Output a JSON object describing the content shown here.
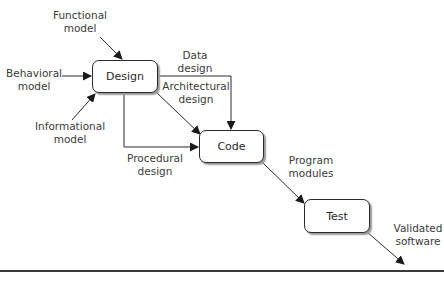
{
  "diagram": {
    "type": "flow",
    "colors": {
      "stroke": "#2a2a2a",
      "text": "#3a3a3a",
      "shadow": "#9a9a9a",
      "background": "#ffffff"
    },
    "nodes": [
      {
        "id": "design",
        "label": "Design"
      },
      {
        "id": "code",
        "label": "Code"
      },
      {
        "id": "test",
        "label": "Test"
      }
    ],
    "inputs": [
      {
        "id": "functional",
        "line1": "Functional",
        "line2": "model",
        "target": "design"
      },
      {
        "id": "behavioral",
        "line1": "Behavioral",
        "line2": "model",
        "target": "design"
      },
      {
        "id": "informational",
        "line1": "Informational",
        "line2": "model",
        "target": "design"
      }
    ],
    "edges": [
      {
        "id": "data",
        "line1": "Data",
        "line2": "design",
        "from": "design",
        "to": "code"
      },
      {
        "id": "architectural",
        "line1": "Architectural",
        "line2": "design",
        "from": "design",
        "to": "code"
      },
      {
        "id": "procedural",
        "line1": "Procedural",
        "line2": "design",
        "from": "design",
        "to": "code"
      },
      {
        "id": "program",
        "line1": "Program",
        "line2": "modules",
        "from": "code",
        "to": "test"
      },
      {
        "id": "validated",
        "line1": "Validated",
        "line2": "software",
        "from": "test",
        "to": "output"
      }
    ]
  }
}
